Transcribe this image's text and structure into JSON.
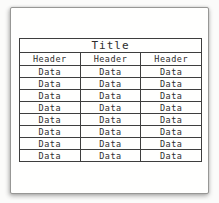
{
  "table": {
    "title": "Title",
    "headers": [
      "Header",
      "Header",
      "Header"
    ],
    "rows": [
      [
        "Data",
        "Data",
        "Data"
      ],
      [
        "Data",
        "Data",
        "Data"
      ],
      [
        "Data",
        "Data",
        "Data"
      ],
      [
        "Data",
        "Data",
        "Data"
      ],
      [
        "Data",
        "Data",
        "Data"
      ],
      [
        "Data",
        "Data",
        "Data"
      ],
      [
        "Data",
        "Data",
        "Data"
      ],
      [
        "Data",
        "Data",
        "Data"
      ]
    ]
  },
  "colors": {
    "table_line": "#3e3e3e",
    "text": "#2e2e2e",
    "paper": "#fffffe",
    "page_background": "#fbfbfa"
  }
}
